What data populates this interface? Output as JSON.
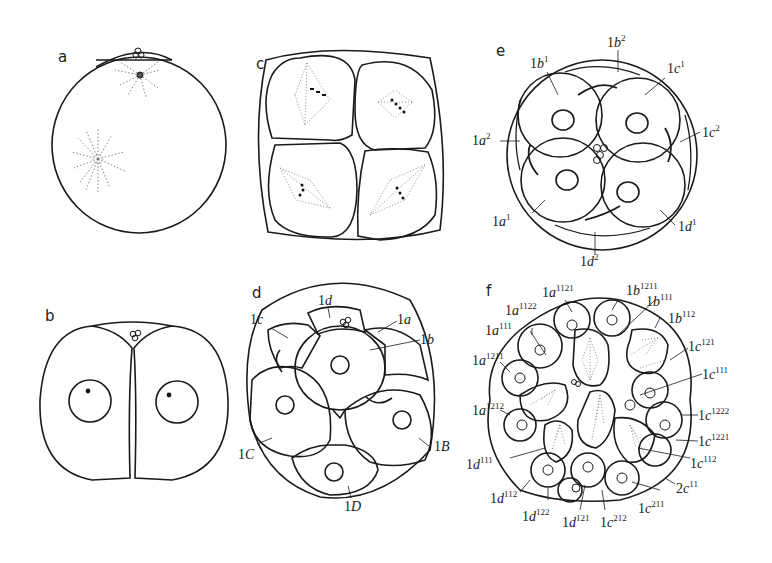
{
  "figure": {
    "line_color": "#1a1a1a",
    "background": "#ffffff"
  },
  "panels": {
    "a": {
      "letter": "a",
      "stage": "uncleaved egg with polar bodies and asters"
    },
    "b": {
      "letter": "b",
      "stage": "two-cell stage"
    },
    "c": {
      "letter": "c",
      "stage": "four-cell stage with mitotic spindles"
    },
    "d": {
      "letter": "d",
      "stage": "eight-cell stage",
      "labels": [
        {
          "base": "1",
          "letter": "d",
          "sup": ""
        },
        {
          "base": "1",
          "letter": "c",
          "sup": ""
        },
        {
          "base": "1",
          "letter": "a",
          "sup": ""
        },
        {
          "base": "1",
          "letter": "b",
          "sup": ""
        },
        {
          "base": "1",
          "letter": "C",
          "sup": ""
        },
        {
          "base": "1",
          "letter": "B",
          "sup": ""
        },
        {
          "base": "1",
          "letter": "D",
          "sup": ""
        }
      ]
    },
    "e": {
      "letter": "e",
      "stage": "sixteen-cell stage",
      "labels": [
        {
          "base": "1",
          "letter": "b",
          "sup": "2"
        },
        {
          "base": "1",
          "letter": "b",
          "sup": "1"
        },
        {
          "base": "1",
          "letter": "c",
          "sup": "1"
        },
        {
          "base": "1",
          "letter": "a",
          "sup": "2"
        },
        {
          "base": "1",
          "letter": "c",
          "sup": "2"
        },
        {
          "base": "1",
          "letter": "a",
          "sup": "1"
        },
        {
          "base": "1",
          "letter": "d",
          "sup": "1"
        },
        {
          "base": "1",
          "letter": "d",
          "sup": "2"
        }
      ]
    },
    "f": {
      "letter": "f",
      "stage": "later cleavage",
      "labels": [
        {
          "base": "1",
          "letter": "a",
          "sup": "1121"
        },
        {
          "base": "1",
          "letter": "b",
          "sup": "1211"
        },
        {
          "base": "1",
          "letter": "b",
          "sup": "111"
        },
        {
          "base": "1",
          "letter": "a",
          "sup": "1122"
        },
        {
          "base": "1",
          "letter": "b",
          "sup": "112"
        },
        {
          "base": "1",
          "letter": "a",
          "sup": "111"
        },
        {
          "base": "1",
          "letter": "c",
          "sup": "121"
        },
        {
          "base": "1",
          "letter": "a",
          "sup": "1211"
        },
        {
          "base": "1",
          "letter": "c",
          "sup": "111"
        },
        {
          "base": "1",
          "letter": "a",
          "sup": "1212"
        },
        {
          "base": "1",
          "letter": "c",
          "sup": "1222"
        },
        {
          "base": "1",
          "letter": "c",
          "sup": "1221"
        },
        {
          "base": "1",
          "letter": "d",
          "sup": "111"
        },
        {
          "base": "1",
          "letter": "c",
          "sup": "112"
        },
        {
          "base": "2",
          "letter": "c",
          "sup": "11"
        },
        {
          "base": "1",
          "letter": "d",
          "sup": "112"
        },
        {
          "base": "1",
          "letter": "d",
          "sup": "122"
        },
        {
          "base": "1",
          "letter": "c",
          "sup": "211"
        },
        {
          "base": "1",
          "letter": "d",
          "sup": "121"
        },
        {
          "base": "1",
          "letter": "c",
          "sup": "212"
        }
      ]
    }
  },
  "caption": {
    "text": ""
  }
}
